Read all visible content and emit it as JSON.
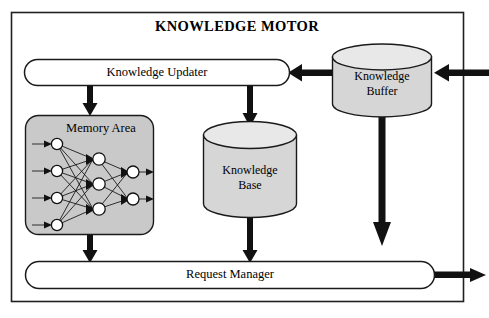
{
  "diagram": {
    "title": "KNOWLEDGE MOTOR",
    "nodes": {
      "knowledge_updater": {
        "label": "Knowledge Updater",
        "shape": "stadium",
        "fill": "#ffffff"
      },
      "memory_area": {
        "label": "Memory Area",
        "shape": "rounded-rect",
        "fill": "#c9c9c9"
      },
      "knowledge_base": {
        "label_line1": "Knowledge",
        "label_line2": "Base",
        "shape": "cylinder",
        "fill": "#d6d6d6"
      },
      "knowledge_buffer": {
        "label_line1": "Knowledge",
        "label_line2": "Buffer",
        "shape": "cylinder",
        "fill": "#d6d6d6"
      },
      "request_manager": {
        "label": "Request Manager",
        "shape": "stadium",
        "fill": "#ffffff"
      }
    },
    "neural_network": {
      "input_nodes": 4,
      "hidden_nodes": 3,
      "output_nodes": 2,
      "node_fill": "#ffffff",
      "edge_color": "#111111"
    },
    "connections": [
      {
        "from": "external-input",
        "to": "knowledge_buffer",
        "direction": "left"
      },
      {
        "from": "knowledge_buffer",
        "to": "knowledge_updater",
        "direction": "left"
      },
      {
        "from": "knowledge_updater",
        "to": "memory_area",
        "direction": "down"
      },
      {
        "from": "knowledge_updater",
        "to": "knowledge_base",
        "direction": "down"
      },
      {
        "from": "knowledge_buffer",
        "to": "request_manager",
        "direction": "down"
      },
      {
        "from": "memory_area",
        "to": "request_manager",
        "direction": "down"
      },
      {
        "from": "knowledge_base",
        "to": "request_manager",
        "direction": "down"
      },
      {
        "from": "request_manager",
        "to": "external-output",
        "direction": "right"
      }
    ],
    "colors": {
      "stroke": "#1a1a1a",
      "frame": "#202020",
      "arrow": "#111111",
      "memory_fill": "#c9c9c9",
      "cylinder_fill": "#d6d6d6",
      "background": "#ffffff"
    }
  }
}
